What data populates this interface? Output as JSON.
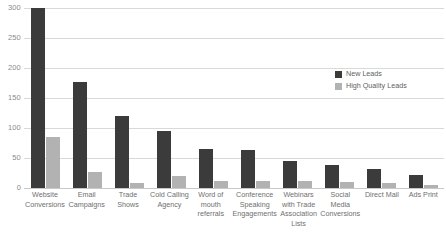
{
  "chart_data": {
    "type": "bar",
    "title": "",
    "xlabel": "",
    "ylabel": "",
    "ylim": [
      0,
      300
    ],
    "yticks": [
      300,
      250,
      200,
      150,
      100,
      50,
      0
    ],
    "grid": true,
    "legend_position": "right",
    "categories": [
      "Website Conversions",
      "Email Campaigns",
      "Trade Shows",
      "Cold Calling Agency",
      "Word of mouth referrals",
      "Conference Speaking Engagements",
      "Webinars with Trade Association Lists",
      "Social Media Conversions",
      "Direct Mail",
      "Ads Print"
    ],
    "series": [
      {
        "name": "New Leads",
        "color": "#3b3b3b",
        "values": [
          300,
          177,
          120,
          95,
          65,
          63,
          45,
          38,
          32,
          22
        ]
      },
      {
        "name": "High Quality Leads",
        "color": "#b2b2b2",
        "values": [
          85,
          27,
          8,
          20,
          12,
          12,
          12,
          10,
          9,
          5
        ]
      }
    ]
  },
  "axis": {
    "y_ticks": [
      "300",
      "250",
      "200",
      "150",
      "100",
      "50",
      "0"
    ],
    "x_labels": [
      "Website Conversions",
      "Email Campaigns",
      "Trade Shows",
      "Cold Calling Agency",
      "Word of mouth referrals",
      "Conference Speaking Engagements",
      "Webinars with Trade Association Lists",
      "Social Media Conversions",
      "Direct Mail",
      "Ads Print"
    ]
  },
  "legend": {
    "items": [
      {
        "label": "New Leads",
        "color": "#3b3b3b"
      },
      {
        "label": "High Quality Leads",
        "color": "#b2b2b2"
      }
    ]
  },
  "colors": {
    "new_leads": "#3b3b3b",
    "high_quality_leads": "#b2b2b2",
    "gridline": "#d9d9d9",
    "tick_text": "#8a8a8a",
    "label_text": "#6f6f6f",
    "background": "#ffffff"
  }
}
